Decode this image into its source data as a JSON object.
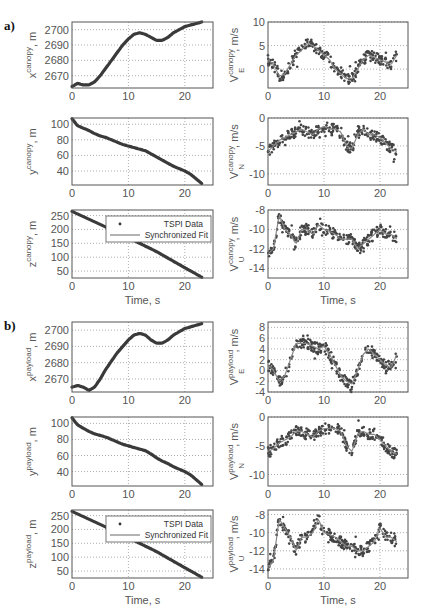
{
  "figure": {
    "panel_labels": [
      "a)",
      "b)"
    ],
    "xlabel": "Time, s",
    "legend": {
      "items": [
        "TSPI Data",
        "Synchronized Fit"
      ]
    }
  },
  "chart_data": [
    {
      "type": "line",
      "group": "a)",
      "title": "",
      "ylabel": "x^canopy, m",
      "xlabel": "",
      "xlim": [
        0,
        25
      ],
      "ylim": [
        2662,
        2705
      ],
      "xticks": [
        0,
        10,
        20
      ],
      "yticks": [
        2670,
        2680,
        2690,
        2700
      ],
      "grid": true,
      "series": [
        {
          "name": "x canopy",
          "x": [
            0,
            1,
            2,
            3,
            4,
            5,
            6,
            7,
            8,
            9,
            10,
            11,
            12,
            13,
            14,
            15,
            16,
            17,
            18,
            19,
            20,
            21,
            22,
            23
          ],
          "values": [
            2663,
            2665,
            2664,
            2664,
            2666,
            2670,
            2675,
            2680,
            2685,
            2690,
            2694,
            2697,
            2698,
            2697,
            2695,
            2693,
            2693,
            2695,
            2698,
            2700,
            2702,
            2703,
            2704,
            2705
          ]
        }
      ]
    },
    {
      "type": "scatter",
      "group": "a)",
      "ylabel": "V_E^canopy, m/s",
      "xlim": [
        0,
        25
      ],
      "ylim": [
        -4,
        10
      ],
      "xticks": [
        0,
        10,
        20
      ],
      "yticks": [
        0,
        5,
        10
      ],
      "grid": true,
      "series": [
        {
          "name": "TSPI Data + Synchronized Fit",
          "x": [
            0,
            1,
            2,
            3,
            4,
            5,
            6,
            7,
            8,
            9,
            10,
            11,
            12,
            13,
            14,
            15,
            16,
            17,
            18,
            19,
            20,
            21,
            22,
            23
          ],
          "values": [
            2,
            1,
            -1.5,
            -1,
            1,
            3,
            4,
            5.5,
            5,
            4,
            3,
            2,
            0,
            -1,
            -2,
            -2,
            0,
            2,
            3,
            2.5,
            2,
            1.5,
            1,
            3
          ]
        }
      ]
    },
    {
      "type": "line",
      "group": "a)",
      "ylabel": "y^canopy, m",
      "xlim": [
        0,
        25
      ],
      "ylim": [
        22,
        108
      ],
      "xticks": [
        0,
        10,
        20
      ],
      "yticks": [
        40,
        60,
        80,
        100
      ],
      "grid": true,
      "series": [
        {
          "name": "y canopy",
          "x": [
            0,
            1,
            2,
            3,
            4,
            5,
            6,
            7,
            8,
            9,
            10,
            11,
            12,
            13,
            14,
            15,
            16,
            17,
            18,
            19,
            20,
            21,
            22,
            23
          ],
          "values": [
            107,
            98,
            95,
            92,
            88,
            85,
            83,
            80,
            77,
            74,
            72,
            70,
            68,
            66,
            62,
            58,
            54,
            50,
            46,
            43,
            40,
            36,
            30,
            24
          ]
        }
      ]
    },
    {
      "type": "scatter",
      "group": "a)",
      "ylabel": "V_N^canopy, m/s",
      "xlim": [
        0,
        25
      ],
      "ylim": [
        -12,
        0
      ],
      "xticks": [
        0,
        10,
        20
      ],
      "yticks": [
        -10,
        -5,
        0
      ],
      "grid": true,
      "series": [
        {
          "name": "TSPI Data + Synchronized Fit",
          "x": [
            0,
            1,
            2,
            3,
            4,
            5,
            6,
            7,
            8,
            9,
            10,
            11,
            12,
            13,
            14,
            15,
            16,
            17,
            18,
            19,
            20,
            21,
            22,
            23
          ],
          "values": [
            -6,
            -5,
            -4,
            -3.5,
            -3,
            -2.5,
            -2,
            -2.5,
            -3,
            -2,
            -1.5,
            -2,
            -2,
            -2.5,
            -5,
            -5.5,
            -3,
            -2,
            -3,
            -3,
            -3.5,
            -4.5,
            -5.5,
            -6
          ]
        }
      ]
    },
    {
      "type": "line",
      "group": "a)",
      "ylabel": "z^canopy, m",
      "xlabel": "Time, s",
      "xlim": [
        0,
        25
      ],
      "ylim": [
        25,
        270
      ],
      "xticks": [
        0,
        10,
        20
      ],
      "yticks": [
        50,
        100,
        150,
        200,
        250
      ],
      "grid": true,
      "legend": [
        "TSPI Data",
        "Synchronized Fit"
      ],
      "series": [
        {
          "name": "z canopy",
          "x": [
            0,
            5,
            10,
            15,
            20,
            23
          ],
          "values": [
            265,
            218,
            170,
            120,
            62,
            28
          ]
        }
      ]
    },
    {
      "type": "scatter",
      "group": "a)",
      "ylabel": "V_U^canopy, m/s",
      "xlabel": "Time, s",
      "xlim": [
        0,
        25
      ],
      "ylim": [
        -15,
        -8
      ],
      "xticks": [
        0,
        10,
        20
      ],
      "yticks": [
        -14,
        -12,
        -10,
        -8
      ],
      "grid": true,
      "series": [
        {
          "name": "TSPI Data + Synchronized Fit",
          "x": [
            0,
            1,
            2,
            3,
            4,
            5,
            6,
            7,
            8,
            9,
            10,
            11,
            12,
            13,
            14,
            15,
            16,
            17,
            18,
            19,
            20,
            21,
            22,
            23
          ],
          "values": [
            -12.5,
            -12,
            -8.5,
            -10,
            -10.5,
            -11.5,
            -10,
            -10,
            -10.5,
            -9.5,
            -10,
            -10.2,
            -10.5,
            -11,
            -11,
            -11,
            -12,
            -11.5,
            -11,
            -10.5,
            -10,
            -10.5,
            -10.5,
            -11
          ]
        }
      ]
    },
    {
      "type": "line",
      "group": "b)",
      "ylabel": "x^payload, m",
      "xlim": [
        0,
        25
      ],
      "ylim": [
        2662,
        2705
      ],
      "xticks": [
        0,
        10,
        20
      ],
      "yticks": [
        2670,
        2680,
        2690,
        2700
      ],
      "grid": true,
      "series": [
        {
          "name": "x payload",
          "x": [
            0,
            1,
            2,
            3,
            4,
            5,
            6,
            7,
            8,
            9,
            10,
            11,
            12,
            13,
            14,
            15,
            16,
            17,
            18,
            19,
            20,
            21,
            22,
            23
          ],
          "values": [
            2665,
            2666,
            2665,
            2663,
            2665,
            2670,
            2676,
            2681,
            2686,
            2690,
            2694,
            2697,
            2698,
            2697,
            2694,
            2692,
            2692,
            2694,
            2697,
            2699,
            2701,
            2702,
            2703,
            2704
          ]
        }
      ]
    },
    {
      "type": "scatter",
      "group": "b)",
      "ylabel": "V_E^payload, m/s",
      "xlim": [
        0,
        25
      ],
      "ylim": [
        -4,
        9
      ],
      "xticks": [
        0,
        10,
        20
      ],
      "yticks": [
        -4,
        -2,
        0,
        2,
        4,
        6,
        8
      ],
      "grid": true,
      "series": [
        {
          "name": "TSPI Data + Synchronized Fit",
          "x": [
            0,
            1,
            2,
            3,
            4,
            5,
            6,
            7,
            8,
            9,
            10,
            11,
            12,
            13,
            14,
            15,
            16,
            17,
            18,
            19,
            20,
            21,
            22,
            23
          ],
          "values": [
            1,
            0,
            -2,
            -1,
            2,
            5,
            5,
            5,
            4.5,
            4,
            4.5,
            3,
            1,
            -1,
            -2,
            -2.5,
            0,
            3,
            4,
            3,
            2,
            1,
            0.5,
            3
          ]
        }
      ]
    },
    {
      "type": "line",
      "group": "b)",
      "ylabel": "y^payload, m",
      "xlim": [
        0,
        25
      ],
      "ylim": [
        22,
        108
      ],
      "xticks": [
        0,
        10,
        20
      ],
      "yticks": [
        40,
        60,
        80,
        100
      ],
      "grid": true,
      "series": [
        {
          "name": "y payload",
          "x": [
            0,
            1,
            2,
            3,
            4,
            5,
            6,
            7,
            8,
            9,
            10,
            11,
            12,
            13,
            14,
            15,
            16,
            17,
            18,
            19,
            20,
            21,
            22,
            23
          ],
          "values": [
            107,
            98,
            94,
            90,
            87,
            85,
            83,
            80,
            77,
            74,
            72,
            70,
            68,
            66,
            62,
            57,
            53,
            50,
            46,
            43,
            40,
            36,
            30,
            24
          ]
        }
      ]
    },
    {
      "type": "scatter",
      "group": "b)",
      "ylabel": "V_N^payload, m/s",
      "xlim": [
        0,
        25
      ],
      "ylim": [
        -12,
        0
      ],
      "xticks": [
        0,
        10,
        20
      ],
      "yticks": [
        -10,
        -5,
        0
      ],
      "grid": true,
      "series": [
        {
          "name": "TSPI Data + Synchronized Fit",
          "x": [
            0,
            1,
            2,
            3,
            4,
            5,
            6,
            7,
            8,
            9,
            10,
            11,
            12,
            13,
            14,
            15,
            16,
            17,
            18,
            19,
            20,
            21,
            22,
            23
          ],
          "values": [
            -6,
            -5.5,
            -4.5,
            -4,
            -3.5,
            -2.5,
            -2.5,
            -3,
            -3.5,
            -2.5,
            -2,
            -2,
            -2,
            -2.5,
            -5,
            -6,
            -3,
            -2.5,
            -3,
            -3,
            -4,
            -5,
            -6,
            -6.5
          ]
        }
      ]
    },
    {
      "type": "line",
      "group": "b)",
      "ylabel": "z^payload, m",
      "xlabel": "Time, s",
      "xlim": [
        0,
        25
      ],
      "ylim": [
        25,
        270
      ],
      "xticks": [
        0,
        10,
        20
      ],
      "yticks": [
        50,
        100,
        150,
        200,
        250
      ],
      "grid": true,
      "legend": [
        "TSPI Data",
        "Synchronized Fit"
      ],
      "series": [
        {
          "name": "z payload",
          "x": [
            0,
            5,
            10,
            15,
            20,
            23
          ],
          "values": [
            265,
            218,
            170,
            120,
            62,
            28
          ]
        }
      ]
    },
    {
      "type": "scatter",
      "group": "b)",
      "ylabel": "V_U^payload, m/s",
      "xlabel": "Time, s",
      "xlim": [
        0,
        25
      ],
      "ylim": [
        -15,
        -7.5
      ],
      "xticks": [
        0,
        10,
        20
      ],
      "yticks": [
        -14,
        -12,
        -10,
        -8
      ],
      "grid": true,
      "series": [
        {
          "name": "TSPI Data + Synchronized Fit",
          "x": [
            0,
            1,
            2,
            3,
            4,
            5,
            6,
            7,
            8,
            9,
            10,
            11,
            12,
            13,
            14,
            15,
            16,
            17,
            18,
            19,
            20,
            21,
            22,
            23
          ],
          "values": [
            -14,
            -13,
            -8.5,
            -9.5,
            -10.5,
            -12,
            -10.5,
            -10.5,
            -10,
            -8.5,
            -10,
            -10.2,
            -10.5,
            -11,
            -11.5,
            -11.5,
            -12,
            -12,
            -11.5,
            -11,
            -9.5,
            -10.5,
            -10.5,
            -11
          ]
        }
      ]
    }
  ]
}
